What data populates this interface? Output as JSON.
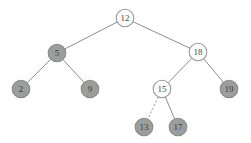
{
  "figure": {
    "width": 251,
    "height": 143,
    "background_color": "#ffffff"
  },
  "style": {
    "filled_node_color": "#9d9d9d",
    "hollow_node_color": "#fdfdfd",
    "node_stroke_color": "#8a8a8a",
    "edge_color": "#8e8e8e",
    "label_color": "#3c3c3c",
    "node_radius": 8.8
  },
  "chart_data": {
    "type": "diagram",
    "diagram_kind": "binary-search-tree",
    "nodes": [
      {
        "id": "n12",
        "label": "12",
        "x": 125,
        "y": 18,
        "fill": "hollow"
      },
      {
        "id": "n5",
        "label": "5",
        "x": 57,
        "y": 53,
        "fill": "filled"
      },
      {
        "id": "n18",
        "label": "18",
        "x": 198,
        "y": 52,
        "fill": "hollow"
      },
      {
        "id": "n2",
        "label": "2",
        "x": 21,
        "y": 89,
        "fill": "filled"
      },
      {
        "id": "n9",
        "label": "9",
        "x": 90,
        "y": 89,
        "fill": "filled"
      },
      {
        "id": "n15",
        "label": "15",
        "x": 162,
        "y": 89,
        "fill": "hollow"
      },
      {
        "id": "n19",
        "label": "19",
        "x": 229,
        "y": 89,
        "fill": "filled"
      },
      {
        "id": "n13",
        "label": "13",
        "x": 144,
        "y": 127,
        "fill": "filled"
      },
      {
        "id": "n17",
        "label": "17",
        "x": 178,
        "y": 127,
        "fill": "filled"
      }
    ],
    "edges": [
      {
        "from": "n12",
        "to": "n5",
        "style": "solid"
      },
      {
        "from": "n12",
        "to": "n18",
        "style": "solid"
      },
      {
        "from": "n5",
        "to": "n2",
        "style": "solid"
      },
      {
        "from": "n5",
        "to": "n9",
        "style": "solid"
      },
      {
        "from": "n18",
        "to": "n15",
        "style": "solid"
      },
      {
        "from": "n18",
        "to": "n19",
        "style": "solid"
      },
      {
        "from": "n15",
        "to": "n13",
        "style": "dashed"
      },
      {
        "from": "n15",
        "to": "n17",
        "style": "solid"
      }
    ]
  }
}
